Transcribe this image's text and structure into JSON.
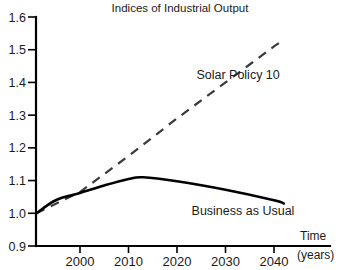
{
  "chart_data": {
    "type": "line",
    "title": "Indices of Industrial Output",
    "xlabel": "Time",
    "xlabel_units": "(years)",
    "ylabel": "",
    "xlim": [
      1991,
      2048
    ],
    "ylim": [
      0.9,
      1.6
    ],
    "grid": false,
    "legend_position": "inline-annotation",
    "yticks": [
      0.9,
      1.0,
      1.1,
      1.2,
      1.3,
      1.4,
      1.5,
      1.6
    ],
    "ytick_labels": [
      "0.9",
      "1.0",
      "1.1",
      "1.2",
      "1.3",
      "1.4",
      "1.5",
      "1.6"
    ],
    "xticks": [
      2000,
      2010,
      2020,
      2030,
      2040
    ],
    "xtick_labels": [
      "2000",
      "2010",
      "2020",
      "2030",
      "2040"
    ],
    "series": [
      {
        "name": "Solar Policy 10",
        "style": "dashed",
        "color": "#3a3a3a",
        "label_x": 2024,
        "label_y": 1.41,
        "x": [
          1991,
          2000,
          2010,
          2020,
          2030,
          2040,
          2042
        ],
        "values": [
          1.0,
          1.065,
          1.175,
          1.29,
          1.4,
          1.51,
          1.53
        ]
      },
      {
        "name": "Business as Usual",
        "style": "solid",
        "color": "#000000",
        "label_x": 2023,
        "label_y": 0.995,
        "x": [
          1991,
          1995,
          2000,
          2005,
          2010,
          2013,
          2020,
          2030,
          2040,
          2042
        ],
        "values": [
          1.0,
          1.04,
          1.062,
          1.085,
          1.105,
          1.11,
          1.098,
          1.072,
          1.04,
          1.03
        ]
      }
    ]
  }
}
